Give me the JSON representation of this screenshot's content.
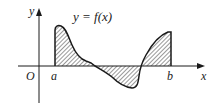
{
  "diagram": {
    "title": "y = f(x)",
    "axes": {
      "x_label": "x",
      "y_label": "y",
      "origin_label": "O"
    },
    "interval": {
      "a_label": "a",
      "b_label": "b"
    },
    "shading": "hatched region between curve and x-axis on [a, b]",
    "colors": {
      "stroke": "#1a1a1a",
      "hatch": "#333333",
      "background": "#ffffff"
    }
  }
}
